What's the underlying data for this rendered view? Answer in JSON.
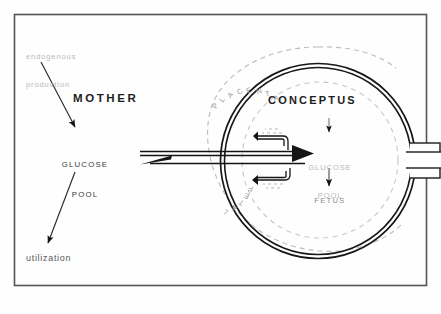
{
  "figure": {
    "background_color": "#fefefe",
    "frame_color": "#4a4a4a",
    "ink_color": "#1a1a1a",
    "faint_ink_color": "#b9b9b9"
  },
  "maternal": {
    "endogenous_production": "endogenous\nproduction",
    "endogenous_line1": "endogenous",
    "endogenous_line2": "production",
    "compartment_label": "MOTHER",
    "glucose_pool_line1": "GLUCOSE",
    "glucose_pool_line2": "POOL",
    "utilization": "utilization"
  },
  "conceptus": {
    "compartment_label": "CONCEPTUS",
    "placenta_label": "PLACENTA",
    "fetal_label": "FETAL",
    "glucose_pool_line1": "GLUCOSE",
    "glucose_pool_line2": "POOL",
    "fetus_label": "FETUS"
  },
  "placenta_letters": [
    "P",
    "L",
    "A",
    "C",
    "E",
    "N",
    "T",
    "A"
  ],
  "fetal_letters": [
    "F",
    "E",
    "T",
    "A",
    "L"
  ],
  "arrows": {
    "endogenous_to_pool": "endogenous-production-to-maternal-pool",
    "pool_to_utilization": "maternal-pool-to-utilization",
    "maternal_to_conceptus": "maternal-to-conceptus-transfer",
    "conceptus_to_maternal": "conceptus-to-maternal-return",
    "conceptus_to_fetal_pool": "conceptus-to-fetal-glucose-pool",
    "fetal_pool_to_fetus": "fetal-glucose-pool-to-fetus",
    "placental_uptake_upper": "placental-uptake-upper-loop",
    "placental_uptake_lower": "placental-uptake-lower-loop"
  }
}
